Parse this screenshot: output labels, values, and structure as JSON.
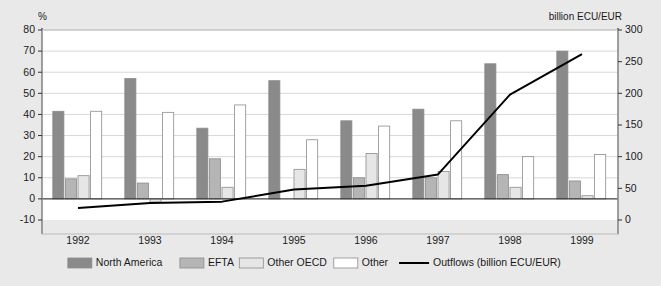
{
  "chart_data": {
    "type": "bar",
    "title": "",
    "subtitle": "",
    "xlabel": "",
    "ylabel": "%",
    "y2label": "billion ECU/EUR",
    "categories": [
      "1992",
      "1993",
      "1994",
      "1995",
      "1996",
      "1997",
      "1998",
      "1999"
    ],
    "ylim": [
      -10,
      80
    ],
    "yticks": [
      "-10",
      "0",
      "10",
      "20",
      "30",
      "40",
      "50",
      "60",
      "70",
      "80"
    ],
    "ytick_values": [
      -10,
      0,
      10,
      20,
      30,
      40,
      50,
      60,
      70,
      80
    ],
    "y2lim": [
      0,
      300
    ],
    "y2ticks": [
      "0",
      "50",
      "100",
      "150",
      "200",
      "250",
      "300"
    ],
    "y2tick_values": [
      0,
      50,
      100,
      150,
      200,
      250,
      300
    ],
    "grid": true,
    "legend_position": "bottom",
    "series": [
      {
        "name": "North America",
        "type": "bar",
        "color": "#8a8a8a",
        "axis": "left",
        "values": [
          41.5,
          57.0,
          33.5,
          56.0,
          37.0,
          42.5,
          64.0,
          70.0
        ]
      },
      {
        "name": "EFTA",
        "type": "bar",
        "color": "#b5b5b5",
        "axis": "left",
        "values": [
          9.5,
          7.5,
          19.0,
          0.0,
          10.0,
          10.0,
          11.5,
          8.5
        ]
      },
      {
        "name": "Other OECD",
        "type": "bar",
        "color": "#e6e6e6",
        "axis": "left",
        "values": [
          11.0,
          -1.5,
          5.5,
          14.0,
          21.5,
          13.0,
          5.5,
          1.5
        ]
      },
      {
        "name": "Other",
        "type": "bar",
        "color": "#ffffff",
        "axis": "left",
        "values": [
          41.5,
          41.0,
          44.5,
          28.0,
          34.5,
          37.0,
          20.0,
          21.0
        ]
      },
      {
        "name": "Outflows (billion ECU/EUR)",
        "type": "line",
        "color": "#000000",
        "axis": "right",
        "values": [
          19,
          27,
          29,
          48,
          54,
          72,
          198,
          262
        ]
      }
    ]
  },
  "legend": {
    "items": [
      {
        "label": "North America",
        "swatch": "#8a8a8a",
        "kind": "box"
      },
      {
        "label": "EFTA",
        "swatch": "#b5b5b5",
        "kind": "box"
      },
      {
        "label": "Other OECD",
        "swatch": "#e6e6e6",
        "kind": "box"
      },
      {
        "label": "Other",
        "swatch": "#ffffff",
        "kind": "box"
      },
      {
        "label": "Outflows (billion ECU/EUR)",
        "swatch": "#000000",
        "kind": "line"
      }
    ]
  }
}
